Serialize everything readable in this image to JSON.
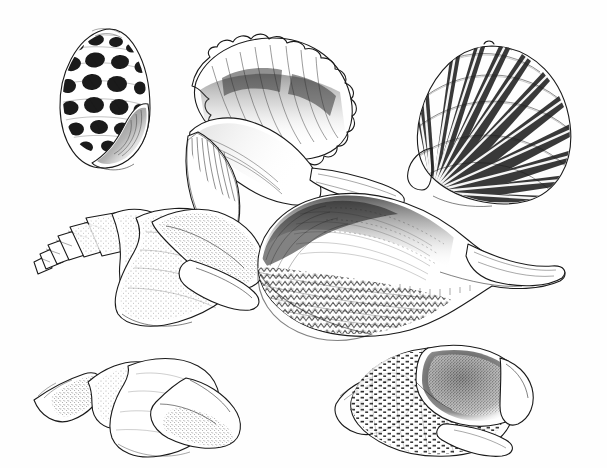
{
  "plate": {
    "title": "Seashell Illustration Plate",
    "medium": "pen-and-ink stipple and hatch drawing",
    "background_color": "#fefefe",
    "ink_color": "#1a1a1a",
    "width": 607,
    "height": 468,
    "caption": "",
    "has_visible_text": false,
    "specimen_count": 7,
    "rows": 3
  },
  "specimens": [
    {
      "id": "shell-nerite-mottled",
      "name": "mottled nerite shell",
      "row": 1,
      "column": 1,
      "orientation": "aperture facing lower right, spire up",
      "bbox": [
        60,
        28,
        90,
        140
      ],
      "pattern": "dark rounded blotches in spiral rows",
      "shading": "solid dark blotches with fine spiral lines between"
    },
    {
      "id": "shell-frilled-conch",
      "name": "frilled conch with crenulated margin",
      "row": 1,
      "column": 2,
      "orientation": "aperture facing viewer, canal to the right",
      "bbox": [
        185,
        33,
        205,
        180
      ],
      "pattern": "stippled spire with ribbed flaring lip",
      "shading": "dense stipple on body whorl, fine parallel ribs on lip"
    },
    {
      "id": "shell-scallop",
      "name": "scallop shell",
      "row": 1,
      "column": 3,
      "orientation": "fan opening to upper right, hinge lower left",
      "bbox": [
        415,
        45,
        155,
        157
      ],
      "pattern": "radiating ribs crossed by concentric growth bands",
      "rib_count": 18,
      "shading": "dark blocky crosshatch between ribs"
    },
    {
      "id": "shell-spired-volute",
      "name": "spired volute with stepped spire",
      "row": 2,
      "column": 1,
      "orientation": "spire to the left, aperture to the right",
      "bbox": [
        32,
        205,
        215,
        130
      ],
      "whorl_count": 6,
      "pattern": "plain with light stipple",
      "shading": "soft stipple gradient on body whorl"
    },
    {
      "id": "shell-large-volute",
      "name": "large volute with zigzag banding",
      "row": 2,
      "column": 2,
      "orientation": "aperture up, siphonal canal to the right",
      "bbox": [
        255,
        193,
        315,
        142
      ],
      "pattern": "zigzag and chevron markings on lower half",
      "shading": "dark hatch along shoulder, pale polished upper surface"
    },
    {
      "id": "shell-tall-spire-whelk",
      "name": "tall-spired whelk",
      "row": 3,
      "column": 1,
      "orientation": "spire to the left, aperture to the right",
      "bbox": [
        32,
        355,
        220,
        105
      ],
      "whorl_count": 7,
      "pattern": "plain white with light stipple",
      "shading": "graded stipple on spire and aperture lip"
    },
    {
      "id": "shell-banded-triton",
      "name": "banded triton whelk",
      "row": 3,
      "column": 2,
      "orientation": "spire to the left, aperture to the upper right",
      "bbox": [
        335,
        340,
        225,
        120
      ],
      "pattern": "crosshatched spiral bands with dark dashes",
      "shading": "dark stippled aperture interior"
    }
  ],
  "palette": {
    "paper": "#fefefe",
    "ink": "#1a1a1a",
    "mid_tone": "#555555",
    "light_tone": "#9a9a9a"
  }
}
